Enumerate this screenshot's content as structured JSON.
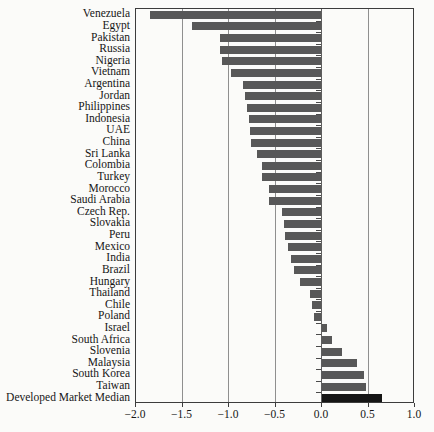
{
  "figure": {
    "background": "#fbfbf9",
    "text_color": "#161616",
    "border_color": "#3c3c3c",
    "gridline_color": "#8f8f8f"
  },
  "chart_data": {
    "type": "bar",
    "orientation": "horizontal",
    "title": "",
    "xlabel": "",
    "ylabel": "",
    "xlim": [
      -2.0,
      1.0
    ],
    "grid": true,
    "legend": "none",
    "bar_color": "#585858",
    "highlight_category": "Developed Market Median",
    "highlight_color": "#151515",
    "categories": [
      "Venezuela",
      "Egypt",
      "Pakistan",
      "Russia",
      "Nigeria",
      "Vietnam",
      "Argentina",
      "Jordan",
      "Philippines",
      "Indonesia",
      "UAE",
      "China",
      "Sri Lanka",
      "Colombia",
      "Turkey",
      "Morocco",
      "Saudi Arabia",
      "Czech Rep.",
      "Slovakia",
      "Peru",
      "Mexico",
      "India",
      "Brazil",
      "Hungary",
      "Thailand",
      "Chile",
      "Poland",
      "Israel",
      "South Africa",
      "Slovenia",
      "Malaysia",
      "South Korea",
      "Taiwan",
      "Developed Market Median"
    ],
    "values": [
      -1.85,
      -1.4,
      -1.1,
      -1.1,
      -1.08,
      -0.98,
      -0.85,
      -0.83,
      -0.81,
      -0.79,
      -0.77,
      -0.76,
      -0.7,
      -0.65,
      -0.64,
      -0.57,
      -0.57,
      -0.43,
      -0.41,
      -0.4,
      -0.37,
      -0.33,
      -0.3,
      -0.24,
      -0.13,
      -0.11,
      -0.09,
      0.06,
      0.12,
      0.23,
      0.39,
      0.46,
      0.48,
      0.66
    ],
    "xticks": [
      -2.0,
      -1.5,
      -1.0,
      -0.5,
      0.0,
      0.5,
      1.0
    ],
    "xtick_labels": [
      "−2.0",
      "−1.5",
      "−1.0",
      "−0.5",
      "0.0",
      "0.5",
      "1.0"
    ]
  }
}
